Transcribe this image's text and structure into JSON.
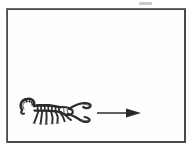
{
  "figure": {
    "kind": "scientific-line-drawing",
    "subject_label": "scorpion",
    "orientation_label": "facing right",
    "arrow_label": "direction of motion arrow",
    "arrow_direction": "right",
    "frame_label": "figure panel border",
    "smudge_label": "scan artifact",
    "colors": {
      "background": "#ffffff",
      "panel_fill": "#fefefe",
      "frame_stroke": "#4a4a4a",
      "ink": "#2b2b2b",
      "ink_light": "#7a7a7a",
      "artifact": "#b9b9b9"
    },
    "geometry": {
      "canvas_width": 194,
      "canvas_height": 150,
      "frame_x": 6,
      "frame_y": 8,
      "frame_width": 180,
      "frame_height": 135,
      "scorpion_x": 16,
      "scorpion_y": 94,
      "arrow_x": 96,
      "arrow_y": 104,
      "arrow_length": 44
    },
    "texts": {
      "title": "",
      "caption": "",
      "annotation": ""
    }
  }
}
